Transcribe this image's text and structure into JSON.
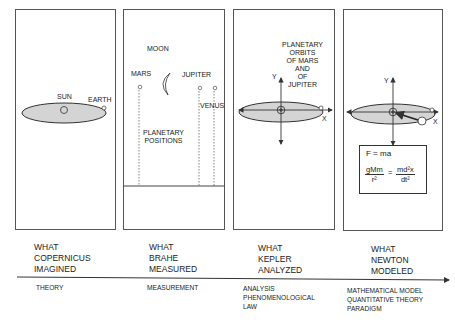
{
  "panels": [
    {
      "id": "copernicus",
      "labels": {
        "sun": "SUN",
        "earth": "EARTH"
      }
    },
    {
      "id": "brahe",
      "labels": {
        "moon": "MOON",
        "mars": "MARS",
        "jupiter": "JUPITER",
        "venus": "VENUS",
        "positions": "PLANETARY\nPOSITIONS"
      }
    },
    {
      "id": "kepler",
      "labels": {
        "orbits": "PLANETARY\nORBITS\nOF MARS\nAND\nOF\nJUPITER",
        "y_axis": "Y",
        "x_axis": "X"
      }
    },
    {
      "id": "newton",
      "labels": {
        "y_axis": "Y",
        "x_axis": "X"
      },
      "formula": {
        "line1": "F = ma",
        "lhs_num": "gMm",
        "lhs_den": "r²",
        "equals": "=",
        "rhs_num": "md²x",
        "rhs_den": "dt²"
      }
    }
  ],
  "timeline": {
    "captions": [
      "WHAT\nCOPERNICUS\nIMAGINED",
      "WHAT\nBRAHE\nMEASURED",
      "WHAT\nKEPLER\nANALYZED",
      "WHAT\nNEWTON\nMODELED"
    ],
    "stages": [
      "THEORY",
      "MEASUREMENT",
      "ANALYSIS\nPHENOMENOLOGICAL\nLAW",
      "MATHEMATICAL MODEL\nQUANTITATIVE THEORY\nPARADIGM"
    ]
  },
  "colors": {
    "orbit_fill": "#d4d4d4",
    "line": "#333333"
  }
}
